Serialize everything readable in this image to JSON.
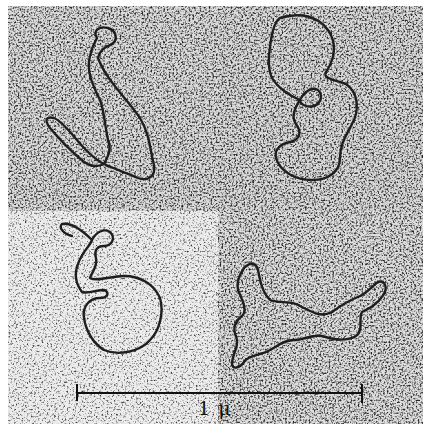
{
  "figure": {
    "kind": "electron micrograph",
    "panel_count": 4,
    "panels": [
      {
        "position": "top-left",
        "tone": "#8a8a8a",
        "molecule": "elongated twisted loop"
      },
      {
        "position": "top-right",
        "tone": "#8c8c8c",
        "molecule": "figure-eight loop with small inner loop"
      },
      {
        "position": "bottom-left",
        "tone": "#b4b4b4",
        "molecule": "open loop with small twisted loops at top"
      },
      {
        "position": "bottom-right",
        "tone": "#8e8e8e",
        "molecule": "extended irregular loop"
      }
    ],
    "scale_bar": {
      "label": "1 μ",
      "color": "#111111"
    },
    "border_color": "#ffffff",
    "strand_color": "#222222"
  }
}
